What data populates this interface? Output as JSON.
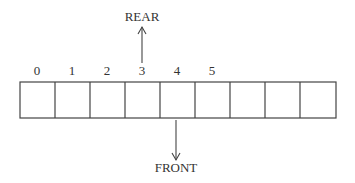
{
  "diagram": {
    "type": "queue-array",
    "cells": 9,
    "indices": [
      "0",
      "1",
      "2",
      "3",
      "4",
      "5"
    ],
    "rear": {
      "label": "REAR",
      "index": 3
    },
    "front": {
      "label": "FRONT",
      "index": 4
    }
  }
}
